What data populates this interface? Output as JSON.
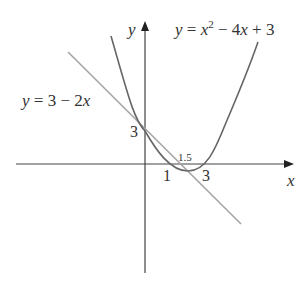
{
  "diagram": {
    "type": "function-graph",
    "axes": {
      "x_label": "x",
      "y_label": "y"
    },
    "curves": [
      {
        "name": "parabola",
        "label": "y = x² − 4x + 3",
        "color": "#555555"
      },
      {
        "name": "tangent-line",
        "label": "y = 3 − 2x",
        "color": "#9a9a9a"
      }
    ],
    "annotations": {
      "y_intercept": "3",
      "root_1": "1",
      "root_3": "3",
      "line_x_intercept": "1.5"
    }
  },
  "labels": {
    "y_axis": "y",
    "x_axis": "x",
    "parabola_y": "y",
    "parabola_eq_mid": " = x",
    "parabola_sup": "2",
    "parabola_rest": " − 4x + 3",
    "line_eq": "y = 3 − 2x",
    "three_y": "3",
    "one": "1",
    "three_x": "3",
    "one_point_five": "1.5"
  }
}
